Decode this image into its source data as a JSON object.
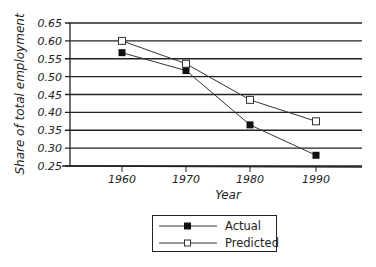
{
  "chart_data": {
    "type": "line",
    "title": "",
    "xlabel": "Year",
    "ylabel": "Share of total employment",
    "x": [
      1960,
      1970,
      1980,
      1990
    ],
    "categories": [
      "1960",
      "1970",
      "1980",
      "1990"
    ],
    "series": [
      {
        "name": "Actual",
        "marker": "filled-square",
        "values": [
          0.567,
          0.517,
          0.365,
          0.28
        ]
      },
      {
        "name": "Predicted",
        "marker": "open-square",
        "values": [
          0.6,
          0.536,
          0.435,
          0.375
        ]
      }
    ],
    "ylim": [
      0.25,
      0.65
    ],
    "yticks": [
      "0.65",
      "0.60",
      "0.55",
      "0.50",
      "0.45",
      "0.40",
      "0.35",
      "0.30",
      "0.25"
    ],
    "grid": true,
    "legend_position": "bottom-center"
  },
  "legend": {
    "actual_label": "Actual",
    "predicted_label": "Predicted"
  },
  "colors": {
    "line": "#333333",
    "grid": "#222222"
  }
}
